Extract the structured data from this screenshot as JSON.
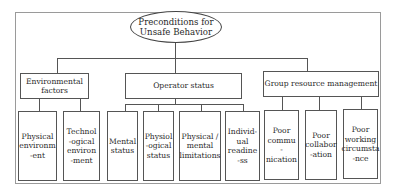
{
  "diagram": {
    "root": {
      "label_lines": [
        "Preconditions for",
        "Unsafe Behavior"
      ]
    },
    "categories": [
      {
        "label_lines": [
          "Environmental",
          "factors"
        ],
        "children": [
          {
            "label_lines": [
              "Physical",
              "environm",
              "-ent"
            ]
          },
          {
            "label_lines": [
              "Technol",
              "-ogical",
              "environ",
              "-ment"
            ]
          }
        ]
      },
      {
        "label_lines": [
          "Operator status"
        ],
        "children": [
          {
            "label_lines": [
              "Mental",
              "status"
            ]
          },
          {
            "label_lines": [
              "Physiol",
              "-ogical",
              "status"
            ]
          },
          {
            "label_lines": [
              "Physical /",
              "mental",
              "limitations"
            ]
          },
          {
            "label_lines": [
              "Individ-",
              "ual",
              "readine",
              "-ss"
            ]
          }
        ]
      },
      {
        "label_lines": [
          "Group resource management"
        ],
        "children": [
          {
            "label_lines": [
              "Poor",
              "commu",
              "-nication"
            ]
          },
          {
            "label_lines": [
              "Poor",
              "collabor",
              "-ation"
            ]
          },
          {
            "label_lines": [
              "Poor",
              "working",
              "circumsta",
              "-nce"
            ]
          }
        ]
      }
    ]
  }
}
